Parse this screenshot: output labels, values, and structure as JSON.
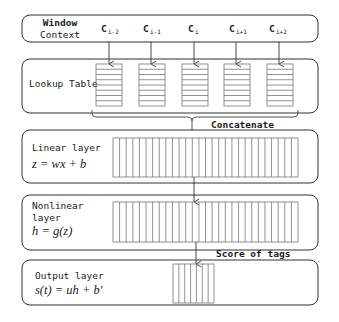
{
  "diagram": {
    "type": "neural-network-architecture",
    "window_context": {
      "label_line1": "Window",
      "label_line2": "Context",
      "tokens": [
        {
          "base": "C",
          "sub": "i-2"
        },
        {
          "base": "C",
          "sub": "i-1"
        },
        {
          "base": "C",
          "sub": "i"
        },
        {
          "base": "C",
          "sub": "i+1"
        },
        {
          "base": "C",
          "sub": "i+2"
        }
      ]
    },
    "lookup_table": {
      "label": "Lookup Table",
      "columns": 5,
      "rows_per_column": 8
    },
    "concatenate_label": "Concatenate",
    "linear_layer": {
      "label": "Linear layer",
      "formula": "z = wx + b",
      "cells": 28
    },
    "nonlinear_layer": {
      "label_line1": "Nonlinear",
      "label_line2": "layer",
      "formula": "h = g(z)",
      "cells": 28
    },
    "score_label": "Score of tags",
    "output_layer": {
      "label": "Output layer",
      "formula": "s(t) = uh + b′",
      "cells": 7
    },
    "colors": {
      "stroke": "#333333",
      "grid_stroke": "#777777",
      "background": "#ffffff"
    }
  }
}
